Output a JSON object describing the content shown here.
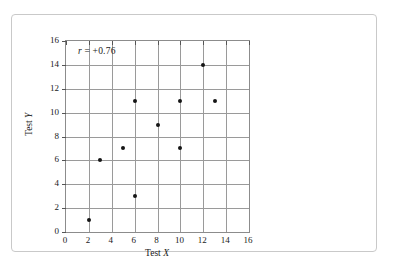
{
  "chart_data": {
    "type": "scatter",
    "title": "",
    "xlabel": "Test X",
    "ylabel": "Test Y",
    "xlim": [
      0,
      16
    ],
    "ylim": [
      0,
      16
    ],
    "xticks": [
      0,
      2,
      4,
      6,
      8,
      10,
      12,
      14,
      16
    ],
    "yticks": [
      0,
      2,
      4,
      6,
      8,
      10,
      12,
      14,
      16
    ],
    "grid": true,
    "legend": null,
    "annotations": [
      {
        "text": "r = +0.76",
        "symbol": "r",
        "rest": " = +0.76",
        "position": "top-left-inside"
      }
    ],
    "points": [
      {
        "x": 2,
        "y": 1
      },
      {
        "x": 3,
        "y": 6
      },
      {
        "x": 5,
        "y": 7
      },
      {
        "x": 6,
        "y": 3
      },
      {
        "x": 6,
        "y": 11
      },
      {
        "x": 8,
        "y": 9
      },
      {
        "x": 10,
        "y": 7
      },
      {
        "x": 10,
        "y": 11
      },
      {
        "x": 12,
        "y": 14
      },
      {
        "x": 13,
        "y": 11
      }
    ],
    "colors": {
      "point": "#151515",
      "grid": "#9a9a9a",
      "axis": "#8c8c8c",
      "text": "#1a1a1a",
      "frame": "#c9c9c9",
      "background": "#ffffff"
    }
  },
  "axis": {
    "x_label_text": "Test ",
    "x_label_var": "X",
    "y_label_text": "Test ",
    "y_label_var": "Y"
  }
}
